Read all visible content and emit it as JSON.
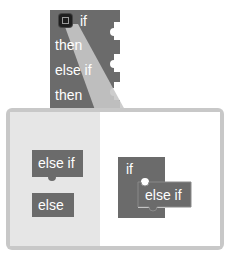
{
  "main_block": {
    "rows": [
      "if",
      "then",
      "else if",
      "then"
    ]
  },
  "mutator": {
    "flyout_blocks": [
      "else if",
      "else"
    ],
    "workspace": {
      "container_label": "if",
      "child_label": "else if"
    }
  },
  "colors": {
    "block": "#6b6b6b",
    "block_dark": "#555555",
    "bubble_border": "#c8c8c8",
    "flyout_bg": "#e6e6e6",
    "workspace_bg": "#ffffff"
  }
}
